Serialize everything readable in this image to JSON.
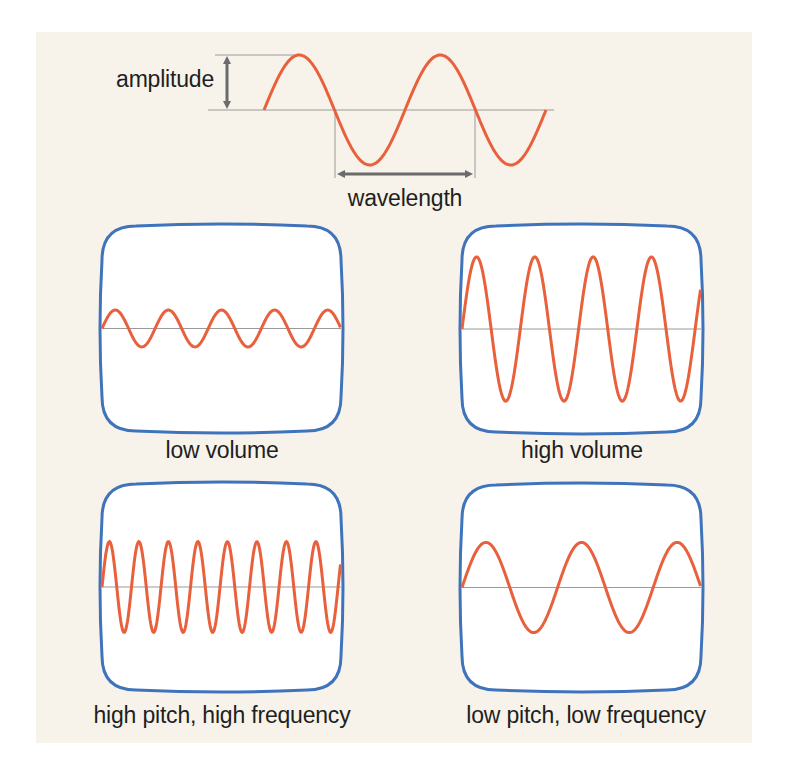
{
  "diagram": {
    "top": {
      "amplitude_label": "amplitude",
      "wavelength_label": "wavelength",
      "wave": {
        "x_start": 264,
        "x_end": 546,
        "axis_y": 110,
        "amplitude": 55,
        "period": 141
      },
      "axis_line": {
        "x1": 208,
        "x2": 554
      }
    },
    "panels": [
      {
        "id": "low-volume",
        "label": "low volume",
        "cycles": 4.5,
        "amplitude": 0.18,
        "phase_deg": 0
      },
      {
        "id": "high-volume",
        "label": "high volume",
        "cycles": 4.1,
        "amplitude": 0.7,
        "phase_deg": 0
      },
      {
        "id": "high-pitch",
        "label": "high pitch, high frequency",
        "cycles": 8.1,
        "amplitude": 0.44,
        "phase_deg": 0
      },
      {
        "id": "low-pitch",
        "label": "low pitch, low frequency",
        "cycles": 2.5,
        "amplitude": 0.44,
        "phase_deg": 0
      }
    ],
    "colors": {
      "background": "#f8f3ea",
      "wave": "#e8603c",
      "screen_border": "#3f74bd",
      "screen_fill": "#ffffff",
      "axis": "#9a9a9a",
      "arrow": "#6b6b6b",
      "text": "#1f1f1f"
    }
  }
}
